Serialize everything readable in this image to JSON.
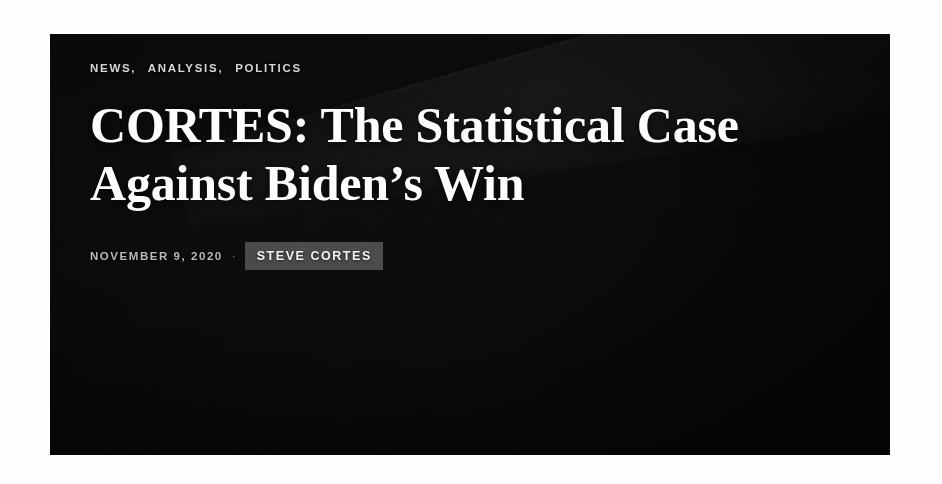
{
  "page": {
    "background_color": "#fefefe"
  },
  "hero": {
    "overlay_color": "#1a1a1a",
    "accent_color": "#aaaaaa",
    "background_image": {
      "name": "mail-in-ballot-envelopes-photo",
      "description": "Dark photograph of stacked mail-in ballot envelopes with postal markings",
      "visible_print_text": "BUSINESS REPLY MAIL"
    },
    "categories": [
      {
        "label": "NEWS",
        "separator": ","
      },
      {
        "label": "ANALYSIS",
        "separator": ","
      },
      {
        "label": "POLITICS",
        "separator": ""
      }
    ],
    "headline": "CORTES: The Statistical Case Against Biden’s Win",
    "byline": {
      "date": "NOVEMBER 9, 2020",
      "separator": "·",
      "author": "STEVE CORTES"
    }
  }
}
